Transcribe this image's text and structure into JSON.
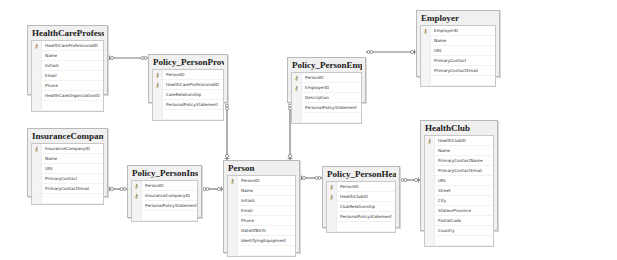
{
  "diagram": {
    "tables": [
      {
        "id": "healthcareprofessional",
        "title": "HealthCareProfessional",
        "box": [
          27,
          25,
          81,
          70
        ],
        "columns": [
          {
            "name": "HealthCareProfessionalID",
            "pk": true
          },
          {
            "name": "Name"
          },
          {
            "name": "Initials"
          },
          {
            "name": "Email"
          },
          {
            "name": "Phone"
          },
          {
            "name": "HealthCareOrganizationID"
          }
        ]
      },
      {
        "id": "policy_personprovider",
        "title": "Policy_PersonProvider",
        "box": [
          148,
          54,
          80,
          49
        ],
        "columns": [
          {
            "name": "PersonID",
            "pk": true
          },
          {
            "name": "HealthCareProfessionalID",
            "pk": true
          },
          {
            "name": "CareRelationship"
          },
          {
            "name": "PersonalPolicyStatement"
          }
        ]
      },
      {
        "id": "policy_personemployer",
        "title": "Policy_PersonEmployer",
        "box": [
          287,
          57,
          79,
          46
        ],
        "columns": [
          {
            "name": "PersonID",
            "pk": true
          },
          {
            "name": "EmployerID",
            "pk": true
          },
          {
            "name": "Description"
          },
          {
            "name": "PersonalPolicyStatement"
          }
        ]
      },
      {
        "id": "employer",
        "title": "Employer",
        "box": [
          416,
          10,
          84,
          67
        ],
        "columns": [
          {
            "name": "EmployerID",
            "pk": true
          },
          {
            "name": "Name"
          },
          {
            "name": "URL"
          },
          {
            "name": "PrimaryContact"
          },
          {
            "name": "PrimaryContactEmail"
          }
        ]
      },
      {
        "id": "insurancecompany",
        "title": "InsuranceCompany",
        "box": [
          27,
          128,
          81,
          69
        ],
        "columns": [
          {
            "name": "InsuranceCompanyID",
            "pk": true
          },
          {
            "name": "Name"
          },
          {
            "name": "URL"
          },
          {
            "name": "PrimaryContact"
          },
          {
            "name": "PrimaryContactEmail"
          }
        ]
      },
      {
        "id": "policy_personinsurance",
        "title": "Policy_PersonInsurance",
        "box": [
          127,
          165,
          75,
          53
        ],
        "columns": [
          {
            "name": "PersonID",
            "pk": true
          },
          {
            "name": "InsuranceCompanyID",
            "pk": true
          },
          {
            "name": "PersonalPolicyStatement"
          }
        ]
      },
      {
        "id": "person",
        "title": "Person",
        "box": [
          223,
          160,
          77,
          93
        ],
        "columns": [
          {
            "name": "PersonID",
            "pk": true
          },
          {
            "name": "Name"
          },
          {
            "name": "Initials"
          },
          {
            "name": "Email"
          },
          {
            "name": "Phone"
          },
          {
            "name": "DateOfBirth"
          },
          {
            "name": "IdentifyingEquipment"
          }
        ]
      },
      {
        "id": "policy_personhealthclub",
        "title": "Policy_PersonHealthClub",
        "box": [
          322,
          166,
          78,
          62
        ],
        "columns": [
          {
            "name": "PersonID",
            "pk": true
          },
          {
            "name": "HealthClubID",
            "pk": true
          },
          {
            "name": "ClubRelationship"
          },
          {
            "name": "PersonalPolicyStatement"
          }
        ]
      },
      {
        "id": "healthclub",
        "title": "HealthClub",
        "box": [
          420,
          120,
          78,
          111
        ],
        "columns": [
          {
            "name": "HealthClubID",
            "pk": true
          },
          {
            "name": "Name"
          },
          {
            "name": "PrimaryContactName"
          },
          {
            "name": "PrimaryContactEmail"
          },
          {
            "name": "URL"
          },
          {
            "name": "Street"
          },
          {
            "name": "City"
          },
          {
            "name": "StateorProvince"
          },
          {
            "name": "PostalCode"
          },
          {
            "name": "Country"
          }
        ]
      }
    ],
    "relationships": [
      {
        "from": "healthcareprofessional",
        "to": "policy_personprovider",
        "points": [
          [
            108,
            58
          ],
          [
            148,
            58
          ]
        ],
        "key_end": "start",
        "many_end": "end"
      },
      {
        "from": "policy_personprovider",
        "to": "person",
        "points": [
          [
            227,
            103
          ],
          [
            227,
            160
          ]
        ],
        "key_end": "end",
        "many_end": "start"
      },
      {
        "from": "policy_personemployer",
        "to": "person",
        "points": [
          [
            290,
            103
          ],
          [
            290,
            160
          ]
        ],
        "key_end": "end",
        "many_end": "start"
      },
      {
        "from": "employer",
        "to": "policy_personemployer",
        "points": [
          [
            366,
            52
          ],
          [
            416,
            52
          ]
        ],
        "key_end": "end",
        "many_end": "start"
      },
      {
        "from": "insurancecompany",
        "to": "policy_personinsurance",
        "points": [
          [
            108,
            189
          ],
          [
            127,
            189
          ]
        ],
        "key_end": "start",
        "many_end": "end"
      },
      {
        "from": "person",
        "to": "policy_personinsurance",
        "points": [
          [
            202,
            189
          ],
          [
            223,
            189
          ]
        ],
        "key_end": "end",
        "many_end": "start"
      },
      {
        "from": "person",
        "to": "policy_personhealthclub",
        "points": [
          [
            300,
            178
          ],
          [
            322,
            178
          ]
        ],
        "key_end": "start",
        "many_end": "end"
      },
      {
        "from": "healthclub",
        "to": "policy_personhealthclub",
        "points": [
          [
            400,
            180
          ],
          [
            420,
            180
          ]
        ],
        "key_end": "end",
        "many_end": "start"
      }
    ],
    "icons": {
      "primary_key": "key-icon",
      "key_end": "key-endpoint-icon",
      "many_end": "infinity-endpoint-icon"
    },
    "colors": {
      "line": "#7a7a7a",
      "box_border": "#b9b9b9",
      "box_bg": "#f0f0f0",
      "key": "#8a6d1a"
    }
  }
}
